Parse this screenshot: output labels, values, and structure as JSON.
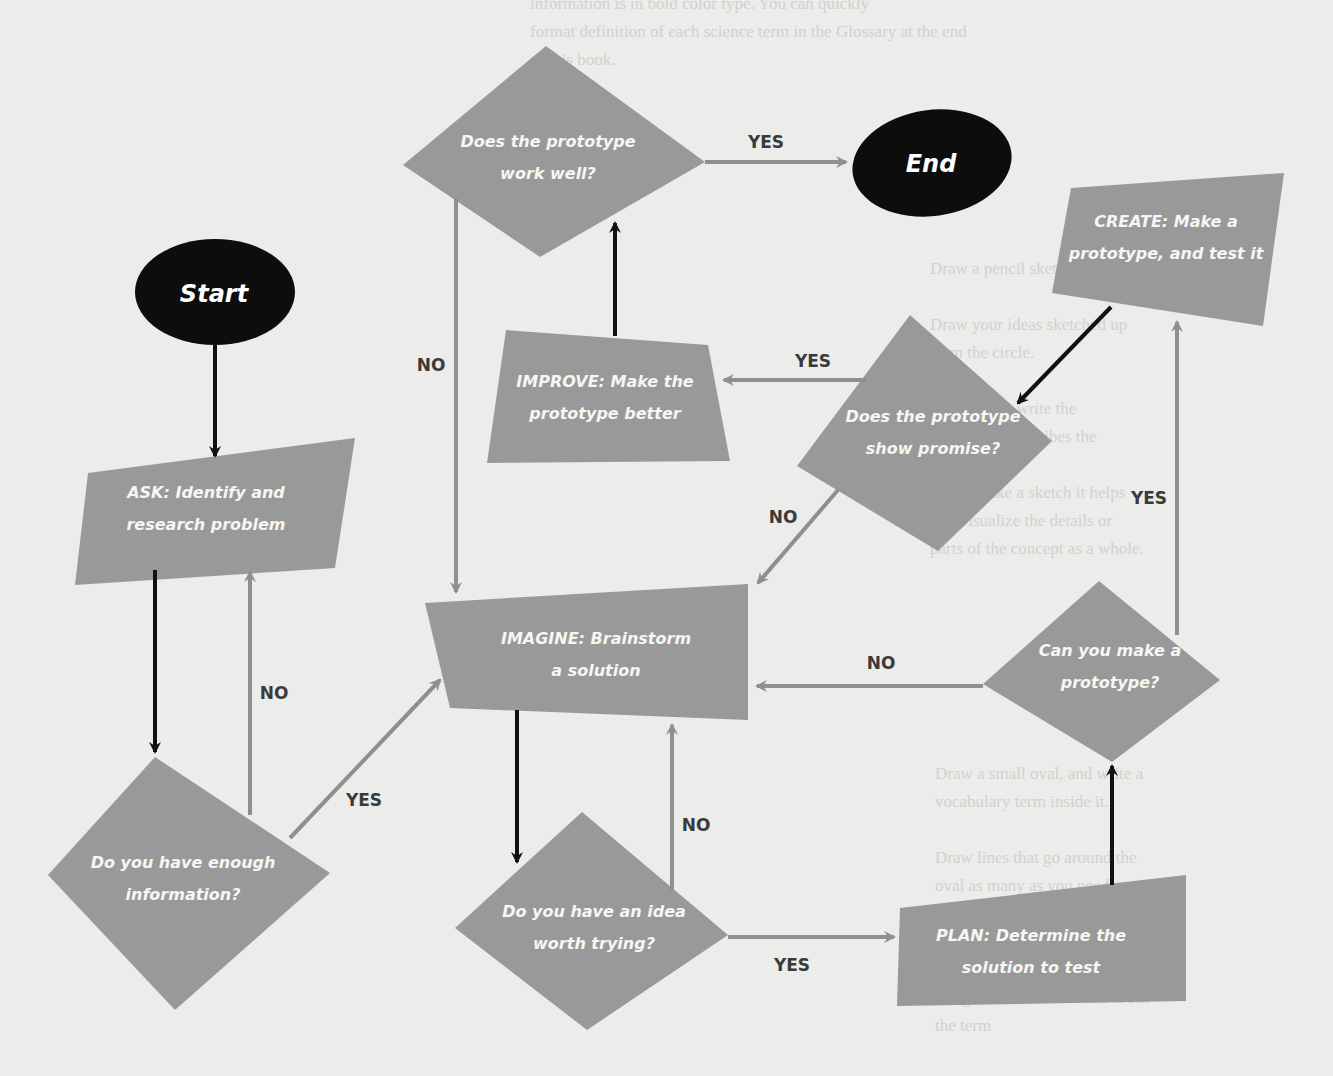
{
  "diagram": {
    "colors": {
      "background": "#ececea",
      "shape_fill": "#999999",
      "terminal_fill": "#0d0d0d",
      "primary_arrow": "#111111",
      "secondary_arrow": "#8f8f8f",
      "edge_label": "#3a3a3a"
    },
    "nodes": {
      "start": {
        "label": "Start",
        "shape": "ellipse"
      },
      "end": {
        "label": "End",
        "shape": "ellipse"
      },
      "ask": {
        "label": "ASK: Identify and\nresearch problem",
        "shape": "parallelogram"
      },
      "enough_info": {
        "label": "Do you have enough\ninformation?",
        "shape": "diamond"
      },
      "imagine": {
        "label": "IMAGINE: Brainstorm\na solution",
        "shape": "trapezoid"
      },
      "idea_worth": {
        "label": "Do you have an idea\nworth trying?",
        "shape": "diamond"
      },
      "plan": {
        "label": "PLAN: Determine the\nsolution to test",
        "shape": "quadrilateral"
      },
      "can_make": {
        "label": "Can you make a\nprototype?",
        "shape": "diamond"
      },
      "create": {
        "label": "CREATE: Make a\nprototype, and test it",
        "shape": "quadrilateral"
      },
      "show_promise": {
        "label": "Does the prototype\nshow promise?",
        "shape": "diamond"
      },
      "improve": {
        "label": "IMPROVE: Make the\nprototype better",
        "shape": "trapezoid"
      },
      "work_well": {
        "label": "Does the prototype\nwork well?",
        "shape": "diamond"
      }
    },
    "edges": [
      {
        "from": "start",
        "to": "ask",
        "label": ""
      },
      {
        "from": "ask",
        "to": "enough_info",
        "label": ""
      },
      {
        "from": "enough_info",
        "to": "ask",
        "label": "NO"
      },
      {
        "from": "enough_info",
        "to": "imagine",
        "label": "YES"
      },
      {
        "from": "imagine",
        "to": "idea_worth",
        "label": ""
      },
      {
        "from": "idea_worth",
        "to": "imagine",
        "label": "NO"
      },
      {
        "from": "idea_worth",
        "to": "plan",
        "label": "YES"
      },
      {
        "from": "plan",
        "to": "can_make",
        "label": ""
      },
      {
        "from": "can_make",
        "to": "imagine",
        "label": "NO"
      },
      {
        "from": "can_make",
        "to": "create",
        "label": "YES"
      },
      {
        "from": "create",
        "to": "show_promise",
        "label": ""
      },
      {
        "from": "show_promise",
        "to": "imagine",
        "label": "NO"
      },
      {
        "from": "show_promise",
        "to": "improve",
        "label": "YES"
      },
      {
        "from": "improve",
        "to": "work_well",
        "label": ""
      },
      {
        "from": "work_well",
        "to": "imagine",
        "label": "NO"
      },
      {
        "from": "work_well",
        "to": "end",
        "label": "YES"
      }
    ],
    "edge_labels": {
      "no_info": "NO",
      "yes_info": "YES",
      "no_idea": "NO",
      "yes_idea": "YES",
      "no_make": "NO",
      "yes_make": "YES",
      "no_promise": "NO",
      "yes_promise": "YES",
      "no_well": "NO",
      "yes_well": "YES"
    }
  },
  "bleed_through": {
    "top": "information is in bold color type. You can quickly\nformat definition of each science term in the Glossary at the end\nof this book.",
    "mid": "Draw a pencil sketch along it\n\nDraw your ideas sketched up\nfrom the circle.\n\nOn the page write the\nphrase that describes the\n\nIf you make a sketch it helps\nyou visualize the details or\nparts of the concept as a whole.",
    "low": "Draw a small oval, and write a\nvocabulary term inside it.\n\nDraw lines that go around the\noval as many as you need\nare long\n\nLabel the smaller ovals with\ncategories of information about\nthe term"
  }
}
